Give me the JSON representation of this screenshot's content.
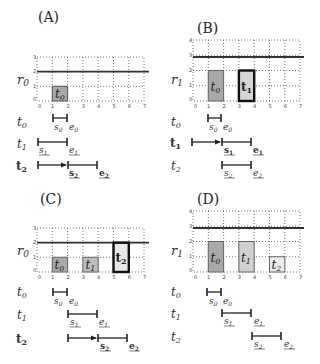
{
  "colors": {
    "box_dark": "#a9a9a9",
    "box_mid": "#bdbdbd",
    "box_light": "#d6d6d6",
    "box_lighter": "#e8e8e8",
    "line": "#222222"
  },
  "panels": [
    {
      "id": "A",
      "title": "(A)",
      "resource_label": "r0",
      "resource_base": "r",
      "resource_sub": "0",
      "x_ticks": [
        "0",
        "1",
        "2",
        "3",
        "4",
        "5",
        "6",
        "7"
      ],
      "y_ticks": [
        "0",
        "1",
        "2",
        "3"
      ],
      "y_max": 3,
      "capacity": 2,
      "boxes": [
        {
          "label_base": "t",
          "label_sub": "0",
          "x0": 1,
          "x1": 2,
          "h": 1,
          "fill": "#a9a9a9",
          "bold": false
        }
      ],
      "timeline": [
        {
          "label_base": "t",
          "label_sub": "0",
          "bold": false,
          "start_label": "s0",
          "end_label": "e0",
          "arrow": false
        },
        {
          "label_base": "t",
          "label_sub": "1",
          "bold": false,
          "start_label": "s1",
          "end_label": "e1",
          "arrow": false
        },
        {
          "label_base": "t",
          "label_sub": "2",
          "bold": true,
          "start_label": "s2",
          "end_label": "e2",
          "arrow": true
        }
      ]
    },
    {
      "id": "B",
      "title": "(B)",
      "resource_label": "r1",
      "resource_base": "r",
      "resource_sub": "1",
      "x_ticks": [
        "0",
        "1",
        "2",
        "3",
        "4",
        "5",
        "6",
        "7"
      ],
      "y_ticks": [
        "0",
        "1",
        "2",
        "3",
        "4"
      ],
      "y_max": 4,
      "capacity": 3,
      "boxes": [
        {
          "label_base": "t",
          "label_sub": "0",
          "x0": 1,
          "x1": 2,
          "h": 2,
          "fill": "#a9a9a9",
          "bold": false
        },
        {
          "label_base": "t",
          "label_sub": "1",
          "x0": 3,
          "x1": 4,
          "h": 2,
          "fill": "#d6d6d6",
          "bold": true
        }
      ],
      "timeline": [
        {
          "label_base": "t",
          "label_sub": "0",
          "bold": false,
          "start_label": "s0",
          "end_label": "e0",
          "arrow": false
        },
        {
          "label_base": "t",
          "label_sub": "1",
          "bold": true,
          "start_label": "s1",
          "end_label": "e1",
          "arrow": true
        },
        {
          "label_base": "t",
          "label_sub": "2",
          "bold": false,
          "start_label": "s2",
          "end_label": "e2",
          "arrow": false
        }
      ]
    },
    {
      "id": "C",
      "title": "(C)",
      "resource_label": "r0",
      "resource_base": "r",
      "resource_sub": "0",
      "x_ticks": [
        "0",
        "1",
        "2",
        "3",
        "4",
        "5",
        "6",
        "7"
      ],
      "y_ticks": [
        "0",
        "1",
        "2",
        "3"
      ],
      "y_max": 3,
      "capacity": 2,
      "boxes": [
        {
          "label_base": "t",
          "label_sub": "0",
          "x0": 1,
          "x1": 2,
          "h": 1,
          "fill": "#a9a9a9",
          "bold": false
        },
        {
          "label_base": "t",
          "label_sub": "1",
          "x0": 3,
          "x1": 4,
          "h": 1,
          "fill": "#bdbdbd",
          "bold": false
        },
        {
          "label_base": "t",
          "label_sub": "2",
          "x0": 5,
          "x1": 6,
          "h": 2,
          "fill": "#e8e8e8",
          "bold": true
        }
      ],
      "timeline": [
        {
          "label_base": "t",
          "label_sub": "0",
          "bold": false,
          "start_label": "s0",
          "end_label": "e0",
          "arrow": false
        },
        {
          "label_base": "t",
          "label_sub": "1",
          "bold": false,
          "start_label": "s1",
          "end_label": "e1",
          "arrow": false
        },
        {
          "label_base": "t",
          "label_sub": "2",
          "bold": true,
          "start_label": "s2",
          "end_label": "e2",
          "arrow": true
        }
      ]
    },
    {
      "id": "D",
      "title": "(D)",
      "resource_label": "r1",
      "resource_base": "r",
      "resource_sub": "1",
      "x_ticks": [
        "0",
        "1",
        "2",
        "3",
        "4",
        "5",
        "6",
        "7"
      ],
      "y_ticks": [
        "0",
        "1",
        "2",
        "3",
        "4"
      ],
      "y_max": 4,
      "capacity": 3,
      "boxes": [
        {
          "label_base": "t",
          "label_sub": "0",
          "x0": 1,
          "x1": 2,
          "h": 2,
          "fill": "#a9a9a9",
          "bold": false
        },
        {
          "label_base": "t",
          "label_sub": "1",
          "x0": 3,
          "x1": 4,
          "h": 2,
          "fill": "#d0d0d0",
          "bold": false
        },
        {
          "label_base": "t",
          "label_sub": "2",
          "x0": 5,
          "x1": 6,
          "h": 1,
          "fill": "#ececec",
          "bold": false
        }
      ],
      "timeline": [
        {
          "label_base": "t",
          "label_sub": "0",
          "bold": false,
          "start_label": "s0",
          "end_label": "e0",
          "arrow": false
        },
        {
          "label_base": "t",
          "label_sub": "1",
          "bold": false,
          "start_label": "s1",
          "end_label": "e1",
          "arrow": false
        },
        {
          "label_base": "t",
          "label_sub": "2",
          "bold": false,
          "start_label": "s2",
          "end_label": "e2",
          "arrow": false
        }
      ]
    }
  ]
}
